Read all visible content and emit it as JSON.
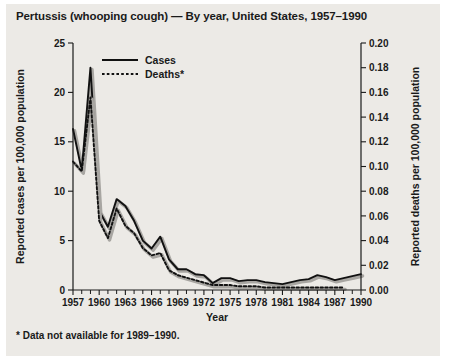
{
  "chart_data": {
    "type": "line",
    "title": "Pertussis (whooping cough) — By year, United States, 1957–1990",
    "footnote": "* Data not available for 1989–1990.",
    "xlabel": "Year",
    "ylabel": "Reported cases per 100,000 population",
    "ylabel_right": "Reported deaths per 100,000 population",
    "xlim": [
      1957,
      1990
    ],
    "ylim": [
      0,
      25
    ],
    "ylim_right": [
      0,
      0.2
    ],
    "grid": false,
    "legend_position": "top-left-inside",
    "ytick_labels": [
      "0",
      "5",
      "10",
      "15",
      "20",
      "25"
    ],
    "ytick_values": [
      0,
      5,
      10,
      15,
      20,
      25
    ],
    "ytick_right_labels": [
      "0.00",
      "0.02",
      "0.04",
      "0.06",
      "0.08",
      "0.10",
      "0.12",
      "0.14",
      "0.16",
      "0.18",
      "0.20"
    ],
    "ytick_right_values": [
      0.0,
      0.02,
      0.04,
      0.06,
      0.08,
      0.1,
      0.12,
      0.14,
      0.16,
      0.18,
      0.2
    ],
    "xtick_labels": [
      "1957",
      "1960",
      "1963",
      "1966",
      "1969",
      "1972",
      "1975",
      "1978",
      "1981",
      "1984",
      "1987",
      "1990"
    ],
    "xtick_values": [
      1957,
      1960,
      1963,
      1966,
      1969,
      1972,
      1975,
      1978,
      1981,
      1984,
      1987,
      1990
    ],
    "x": [
      1957,
      1958,
      1959,
      1960,
      1961,
      1962,
      1963,
      1964,
      1965,
      1966,
      1967,
      1968,
      1969,
      1970,
      1971,
      1972,
      1973,
      1974,
      1975,
      1976,
      1977,
      1978,
      1979,
      1980,
      1981,
      1982,
      1983,
      1984,
      1985,
      1986,
      1987,
      1988,
      1989,
      1990
    ],
    "series": [
      {
        "name": "Cases",
        "axis": "left",
        "style": "solid",
        "values": [
          16.3,
          12.1,
          22.5,
          8.0,
          6.4,
          9.2,
          8.5,
          7.0,
          5.0,
          4.2,
          5.4,
          3.1,
          2.1,
          2.1,
          1.6,
          1.5,
          0.7,
          1.2,
          1.2,
          0.9,
          1.0,
          1.0,
          0.8,
          0.7,
          0.6,
          0.8,
          1.0,
          1.1,
          1.5,
          1.3,
          1.0,
          1.2,
          1.4,
          1.6
        ]
      },
      {
        "name": "Deaths*",
        "axis": "right",
        "style": "dotted",
        "values": [
          0.104,
          0.096,
          0.156,
          0.056,
          0.042,
          0.066,
          0.052,
          0.046,
          0.034,
          0.028,
          0.03,
          0.016,
          0.012,
          0.01,
          0.008,
          0.006,
          0.004,
          0.004,
          0.004,
          0.003,
          0.003,
          0.003,
          0.002,
          0.002,
          0.002,
          0.002,
          0.002,
          0.002,
          0.002,
          0.002,
          0.002,
          0.002,
          null,
          null
        ]
      }
    ]
  }
}
